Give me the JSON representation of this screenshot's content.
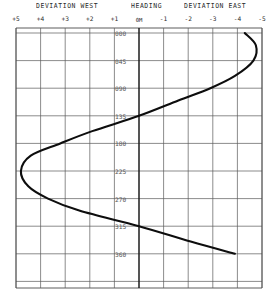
{
  "titles": {
    "west": "DEVIATION WEST",
    "heading": "HEADING",
    "east": "DEVIATION EAST"
  },
  "chart_data": {
    "type": "line",
    "xlabel": "Deviation (degrees)",
    "ylabel": "Heading",
    "grid": true,
    "legend": null,
    "orientation": "vertical-heading",
    "x_tick_labels": [
      "+5",
      "+4",
      "+3",
      "+2",
      "+1",
      "0M",
      "-1",
      "-2",
      "-3",
      "-4",
      "-5"
    ],
    "x_tick_values": [
      5,
      4,
      3,
      2,
      1,
      0,
      -1,
      -2,
      -3,
      -4,
      -5
    ],
    "xlim": [
      5,
      -5
    ],
    "y_tick_labels": [
      "000",
      "045",
      "090",
      "135",
      "180",
      "225",
      "270",
      "315",
      "360"
    ],
    "y_tick_values": [
      0,
      45,
      90,
      135,
      180,
      225,
      270,
      315,
      360
    ],
    "ylim": [
      -20,
      420
    ],
    "series": [
      {
        "name": "deviation",
        "points": [
          {
            "heading": 0,
            "deviation": -4.3
          },
          {
            "heading": 20,
            "deviation": -4.75
          },
          {
            "heading": 45,
            "deviation": -4.65
          },
          {
            "heading": 70,
            "deviation": -3.9
          },
          {
            "heading": 90,
            "deviation": -2.9
          },
          {
            "heading": 110,
            "deviation": -1.6
          },
          {
            "heading": 135,
            "deviation": 0.0
          },
          {
            "heading": 160,
            "deviation": 1.9
          },
          {
            "heading": 180,
            "deviation": 3.2
          },
          {
            "heading": 200,
            "deviation": 4.4
          },
          {
            "heading": 225,
            "deviation": 4.8
          },
          {
            "heading": 250,
            "deviation": 4.5
          },
          {
            "heading": 270,
            "deviation": 3.7
          },
          {
            "heading": 290,
            "deviation": 2.4
          },
          {
            "heading": 315,
            "deviation": 0.0
          },
          {
            "heading": 340,
            "deviation": -2.1
          },
          {
            "heading": 360,
            "deviation": -3.9
          }
        ]
      }
    ]
  }
}
